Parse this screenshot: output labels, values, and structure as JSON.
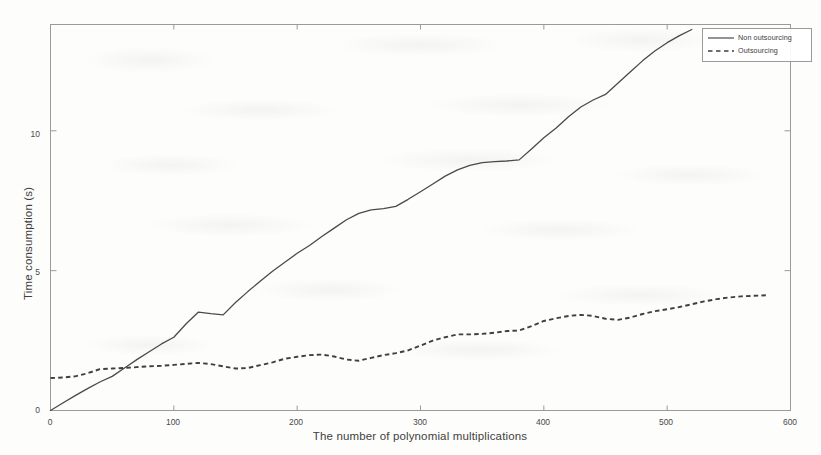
{
  "chart_data": {
    "type": "line",
    "title": "",
    "xlabel": "The number of polynomial multiplications",
    "ylabel": "Time consumption (s)",
    "xlim": [
      0,
      600
    ],
    "ylim": [
      0,
      13.8
    ],
    "xticks": [
      0,
      100,
      200,
      300,
      400,
      500,
      600
    ],
    "xtick_labels": [
      "0",
      "100",
      "200",
      "300",
      "400",
      "500",
      "600"
    ],
    "yticks": [
      0,
      5,
      10
    ],
    "ytick_labels": [
      "0",
      "5",
      "10"
    ],
    "grid": false,
    "legend_position": "top-right",
    "series": [
      {
        "name": "Non outsourcing",
        "style": "solid",
        "color": "#4a4a4a",
        "x": [
          0,
          10,
          20,
          30,
          40,
          50,
          60,
          70,
          80,
          90,
          100,
          110,
          120,
          130,
          140,
          150,
          160,
          170,
          180,
          190,
          200,
          210,
          220,
          230,
          240,
          250,
          260,
          270,
          280,
          290,
          300,
          310,
          320,
          330,
          340,
          350,
          360,
          370,
          380,
          390,
          400,
          410,
          420,
          430,
          440,
          450,
          460,
          470,
          480,
          490,
          500,
          510,
          520
        ],
        "y": [
          0.0,
          0.27,
          0.53,
          0.78,
          1.02,
          1.22,
          1.52,
          1.82,
          2.1,
          2.38,
          2.62,
          3.1,
          3.52,
          3.46,
          3.42,
          3.86,
          4.25,
          4.62,
          4.98,
          5.3,
          5.62,
          5.9,
          6.22,
          6.52,
          6.82,
          7.05,
          7.17,
          7.22,
          7.3,
          7.55,
          7.82,
          8.1,
          8.38,
          8.6,
          8.76,
          8.86,
          8.9,
          8.92,
          8.96,
          9.35,
          9.75,
          10.1,
          10.5,
          10.85,
          11.1,
          11.3,
          11.7,
          12.1,
          12.5,
          12.85,
          13.15,
          13.4,
          13.62
        ]
      },
      {
        "name": "Outsourcing",
        "style": "dashed",
        "color": "#3f3f3f",
        "x": [
          0,
          10,
          20,
          30,
          40,
          50,
          60,
          70,
          80,
          90,
          100,
          110,
          120,
          130,
          140,
          150,
          160,
          170,
          180,
          190,
          200,
          210,
          220,
          230,
          240,
          250,
          260,
          270,
          280,
          290,
          300,
          310,
          320,
          330,
          340,
          350,
          360,
          370,
          380,
          390,
          400,
          410,
          420,
          430,
          440,
          450,
          460,
          470,
          480,
          490,
          500,
          510,
          520,
          530,
          540,
          550,
          560,
          570,
          580
        ],
        "y": [
          1.16,
          1.18,
          1.22,
          1.33,
          1.48,
          1.5,
          1.52,
          1.55,
          1.58,
          1.6,
          1.63,
          1.67,
          1.7,
          1.66,
          1.58,
          1.5,
          1.52,
          1.62,
          1.72,
          1.85,
          1.92,
          1.98,
          2.0,
          1.93,
          1.82,
          1.78,
          1.88,
          1.98,
          2.05,
          2.15,
          2.32,
          2.5,
          2.62,
          2.72,
          2.72,
          2.74,
          2.78,
          2.84,
          2.86,
          3.02,
          3.2,
          3.3,
          3.38,
          3.42,
          3.38,
          3.28,
          3.24,
          3.32,
          3.45,
          3.55,
          3.62,
          3.7,
          3.8,
          3.9,
          3.98,
          4.04,
          4.08,
          4.1,
          4.12
        ]
      }
    ],
    "legend_entries": [
      {
        "label": "Non outsourcing",
        "style": "solid"
      },
      {
        "label": "Outsourcing",
        "style": "dashed"
      }
    ]
  },
  "axes": {
    "ylabel": "Time consumption (s)",
    "xlabel": "The number of polynomial multiplications",
    "ytick_0": "0",
    "ytick_5": "5",
    "ytick_10": "10",
    "xtick_0": "0",
    "xtick_100": "100",
    "xtick_200": "200",
    "xtick_300": "300",
    "xtick_400": "400",
    "xtick_500": "500",
    "xtick_600": "600"
  },
  "legend": {
    "item_1": "Non outsourcing",
    "item_2": "Outsourcing"
  },
  "colors": {
    "line": "#4a4a4a",
    "axis": "#8a8a8a",
    "text": "#3f3f3f",
    "background": "#fdfdfc"
  }
}
